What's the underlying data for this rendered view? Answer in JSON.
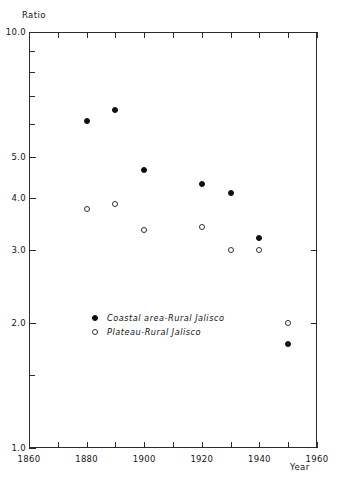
{
  "chart_data": {
    "type": "scatter",
    "title": "",
    "ylabel": "Ratio",
    "xlabel": "Year",
    "xlim": [
      1860,
      1960
    ],
    "ylim": [
      1.0,
      10.0
    ],
    "yscale": "log",
    "grid": false,
    "legend_position": "inside-lower-left",
    "x_ticks_major": [
      "1860",
      "1880",
      "1900",
      "1920",
      "1940",
      "1960"
    ],
    "x_tick_values_major": [
      1860,
      1880,
      1900,
      1920,
      1940,
      1960
    ],
    "x_tick_values_minor": [
      1870,
      1890,
      1910,
      1930,
      1950
    ],
    "y_ticks_major": [
      "10.0",
      "5.0",
      "4.0",
      "3.0",
      "2.0",
      "1.0"
    ],
    "y_tick_values_major": [
      10.0,
      5.0,
      4.0,
      3.0,
      2.0,
      1.0
    ],
    "y_tick_values_minor": [
      9.0,
      8.0,
      7.0,
      6.0,
      1.5
    ],
    "series": [
      {
        "name": "Coastal area-Rural Jalisco",
        "marker": "filled-circle",
        "color": "#0d0d0d",
        "points": [
          {
            "x": 1880,
            "y": 6.1
          },
          {
            "x": 1890,
            "y": 6.5
          },
          {
            "x": 1900,
            "y": 4.65
          },
          {
            "x": 1920,
            "y": 4.3
          },
          {
            "x": 1930,
            "y": 4.1
          },
          {
            "x": 1940,
            "y": 3.2
          },
          {
            "x": 1950,
            "y": 1.78
          }
        ]
      },
      {
        "name": "Plateau-Rural Jalisco",
        "marker": "open-circle",
        "color": "#2f2f2f",
        "points": [
          {
            "x": 1880,
            "y": 3.75
          },
          {
            "x": 1890,
            "y": 3.85
          },
          {
            "x": 1900,
            "y": 3.35
          },
          {
            "x": 1920,
            "y": 3.4
          },
          {
            "x": 1930,
            "y": 3.0
          },
          {
            "x": 1940,
            "y": 3.0
          },
          {
            "x": 1950,
            "y": 2.0
          }
        ]
      }
    ]
  },
  "legend": {
    "items": [
      {
        "label": "Coastal area-Rural Jalisco",
        "marker": "filled-circle"
      },
      {
        "label": "Plateau-Rural Jalisco",
        "marker": "open-circle"
      }
    ]
  }
}
